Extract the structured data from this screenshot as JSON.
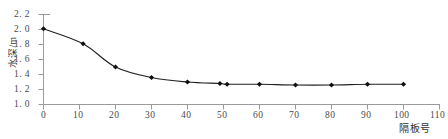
{
  "chart_data": {
    "type": "line",
    "title": "",
    "xlabel": "隔板号",
    "ylabel": "水深/m",
    "x": [
      0,
      11,
      20,
      30,
      40,
      49,
      51,
      60,
      70,
      80,
      90,
      100
    ],
    "values": [
      2.01,
      1.81,
      1.5,
      1.36,
      1.3,
      1.28,
      1.27,
      1.27,
      1.26,
      1.26,
      1.27,
      1.27
    ],
    "series": [
      {
        "name": "水深",
        "x": [
          0,
          11,
          20,
          30,
          40,
          49,
          51,
          60,
          70,
          80,
          90,
          100
        ],
        "values": [
          2.01,
          1.81,
          1.5,
          1.36,
          1.3,
          1.28,
          1.27,
          1.27,
          1.26,
          1.26,
          1.27,
          1.27
        ]
      }
    ],
    "xlim": [
      0,
      110
    ],
    "ylim": [
      1.0,
      2.2
    ],
    "xticks": [
      0,
      10,
      20,
      30,
      40,
      50,
      60,
      70,
      80,
      90,
      100,
      110
    ],
    "xtick_labels": [
      "0",
      "10",
      "20",
      "30",
      "40",
      "50",
      "60",
      "70",
      "80",
      "90",
      "100",
      "110"
    ],
    "yticks": [
      1.0,
      1.2,
      1.4,
      1.6,
      1.8,
      2.0,
      2.2
    ],
    "ytick_labels": [
      "1. 0",
      "1. 2",
      "1. 4",
      "1. 6",
      "1. 8",
      "2. 0",
      "2. 2"
    ],
    "grid": false,
    "legend": null,
    "marker": "diamond",
    "line_color": "#202020",
    "marker_color": "#101010",
    "axis_color": "#808080"
  },
  "axes": {
    "y_axis_title": "水深/m",
    "x_axis_title": "隔板号"
  }
}
